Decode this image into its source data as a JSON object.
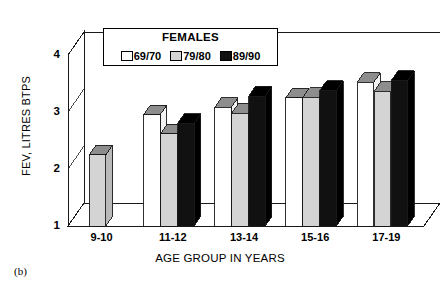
{
  "caption": "(b)",
  "chart_data": {
    "type": "bar",
    "title": "",
    "legend_title": "FEMALES",
    "legend_position": "top-center-inside",
    "xlabel": "AGE GROUP IN YEARS",
    "ylabel": "FEV, LITRES BTPS",
    "categories": [
      "9-10",
      "11-12",
      "13-14",
      "15-16",
      "17-19"
    ],
    "yticks": [
      "1",
      "2",
      "3",
      "4"
    ],
    "ylim": [
      1,
      4
    ],
    "grid": false,
    "three_d": true,
    "series": [
      {
        "name": "69/70",
        "color": "#ffffff",
        "values": [
          null,
          2.95,
          3.08,
          3.25,
          3.52
        ]
      },
      {
        "name": "79/80",
        "color": "#d4d4d4",
        "values": [
          2.25,
          2.62,
          2.98,
          3.26,
          3.36
        ]
      },
      {
        "name": "89/90",
        "color": "#111111",
        "values": [
          null,
          2.8,
          3.28,
          3.38,
          3.55
        ]
      }
    ]
  }
}
